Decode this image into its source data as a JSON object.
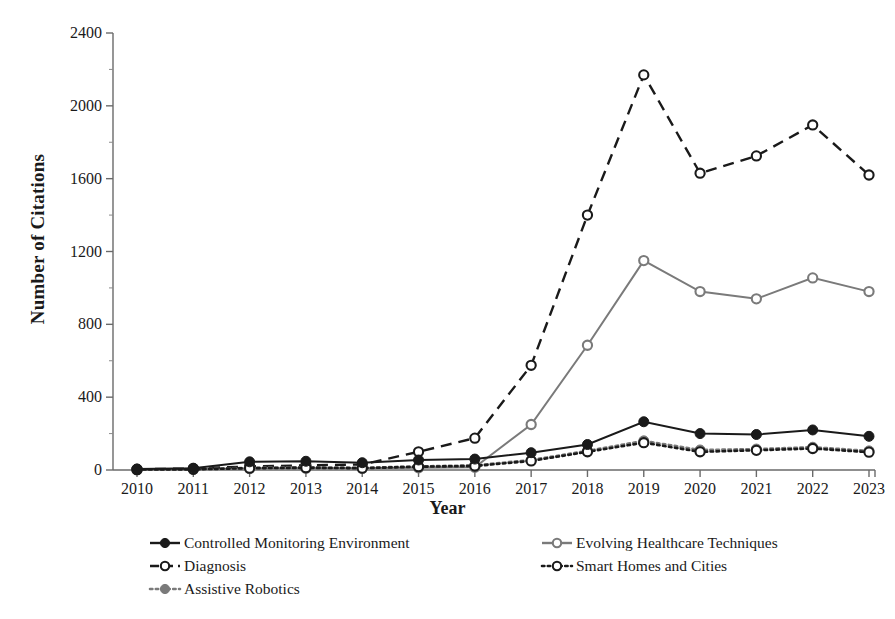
{
  "chart_data": {
    "type": "line",
    "title": "",
    "xlabel": "Year",
    "ylabel": "Number of Citations",
    "x": [
      2010,
      2011,
      2012,
      2013,
      2014,
      2015,
      2016,
      2017,
      2018,
      2019,
      2020,
      2021,
      2022,
      2023
    ],
    "xticklabels": [
      "2010",
      "2011",
      "2012",
      "2013",
      "2014",
      "2015",
      "2016",
      "2017",
      "2018",
      "2019",
      "2020",
      "2021",
      "2022",
      "2023"
    ],
    "yticks": [
      0,
      400,
      800,
      1200,
      1600,
      2000,
      2400
    ],
    "yticklabels": [
      "0",
      "400",
      "800",
      "1200",
      "1600",
      "2000",
      "2400"
    ],
    "ylim": [
      0,
      2400
    ],
    "xlim": [
      2010,
      2023
    ],
    "grid": false,
    "legend_position": "below",
    "series": [
      {
        "name": "Controlled Monitoring Environment",
        "color": "#1a1a1a",
        "line_style": "solid",
        "marker": "filled-circle",
        "values": [
          5,
          10,
          45,
          48,
          40,
          55,
          60,
          95,
          140,
          265,
          200,
          195,
          220,
          185
        ]
      },
      {
        "name": "Diagnosis",
        "color": "#1a1a1a",
        "line_style": "dashed",
        "marker": "open-circle",
        "values": [
          4,
          8,
          20,
          25,
          30,
          100,
          175,
          575,
          1400,
          2170,
          1630,
          1725,
          1895,
          1620
        ]
      },
      {
        "name": "Assistive Robotics",
        "color": "#7a7a7a",
        "line_style": "dotted",
        "marker": "filled-circle",
        "values": [
          3,
          5,
          12,
          15,
          12,
          20,
          25,
          55,
          105,
          160,
          110,
          115,
          125,
          105
        ]
      },
      {
        "name": "Evolving Healthcare Techniques",
        "color": "#7a7a7a",
        "line_style": "solid",
        "marker": "open-circle",
        "values": [
          2,
          4,
          8,
          10,
          10,
          12,
          15,
          250,
          685,
          1150,
          980,
          940,
          1055,
          980
        ]
      },
      {
        "name": "Smart Homes and Cities",
        "color": "#1a1a1a",
        "line_style": "dotted",
        "marker": "open-circle",
        "values": [
          2,
          4,
          10,
          12,
          10,
          18,
          22,
          50,
          100,
          150,
          100,
          108,
          118,
          98
        ]
      }
    ]
  }
}
